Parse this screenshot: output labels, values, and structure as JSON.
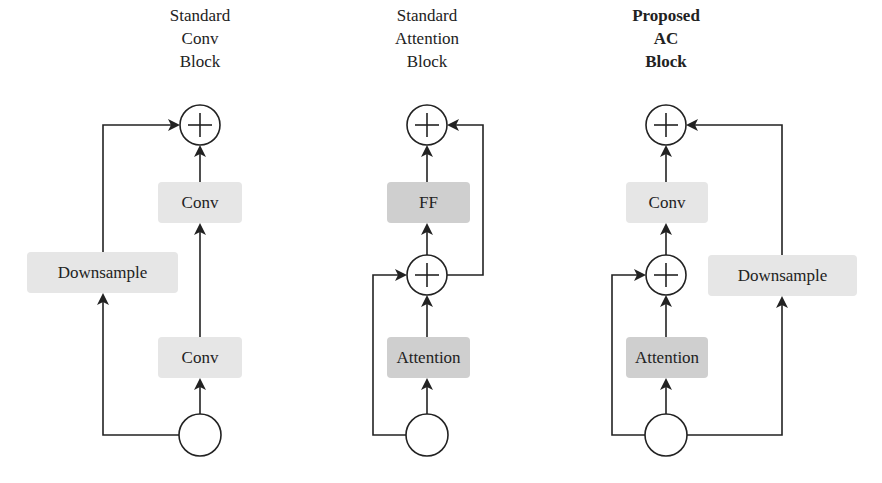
{
  "colors": {
    "background": "#ffffff",
    "line": "#222222",
    "light_box": "#e6e6e6",
    "dark_box": "#cfcfcf"
  },
  "blocks": [
    {
      "title": [
        "Standard",
        "Conv",
        "Block"
      ],
      "title_bold": false,
      "nodes": [
        {
          "id": "sum",
          "type": "add",
          "label": "+"
        },
        {
          "id": "conv2",
          "type": "box",
          "label": "Conv",
          "shade": "light"
        },
        {
          "id": "downsample",
          "type": "box",
          "label": "Downsample",
          "shade": "light"
        },
        {
          "id": "conv1",
          "type": "box",
          "label": "Conv",
          "shade": "light"
        },
        {
          "id": "input",
          "type": "input-node",
          "label": ""
        }
      ],
      "edges": [
        [
          "input",
          "conv1"
        ],
        [
          "conv1",
          "conv2"
        ],
        [
          "conv2",
          "sum"
        ],
        [
          "input",
          "downsample"
        ],
        [
          "downsample",
          "sum"
        ]
      ]
    },
    {
      "title": [
        "Standard",
        "Attention",
        "Block"
      ],
      "title_bold": false,
      "nodes": [
        {
          "id": "sum2",
          "type": "add",
          "label": "+"
        },
        {
          "id": "ff",
          "type": "box",
          "label": "FF",
          "shade": "dark"
        },
        {
          "id": "sum1",
          "type": "add",
          "label": "+"
        },
        {
          "id": "attention",
          "type": "box",
          "label": "Attention",
          "shade": "dark"
        },
        {
          "id": "input",
          "type": "input-node",
          "label": ""
        }
      ],
      "edges": [
        [
          "input",
          "attention"
        ],
        [
          "attention",
          "sum1"
        ],
        [
          "input",
          "sum1"
        ],
        [
          "sum1",
          "ff"
        ],
        [
          "ff",
          "sum2"
        ],
        [
          "sum1",
          "sum2"
        ]
      ]
    },
    {
      "title": [
        "Proposed",
        "AC",
        "Block"
      ],
      "title_bold": true,
      "nodes": [
        {
          "id": "sum2",
          "type": "add",
          "label": "+"
        },
        {
          "id": "conv",
          "type": "box",
          "label": "Conv",
          "shade": "light"
        },
        {
          "id": "sum1",
          "type": "add",
          "label": "+"
        },
        {
          "id": "attention",
          "type": "box",
          "label": "Attention",
          "shade": "dark"
        },
        {
          "id": "downsample",
          "type": "box",
          "label": "Downsample",
          "shade": "light"
        },
        {
          "id": "input",
          "type": "input-node",
          "label": ""
        }
      ],
      "edges": [
        [
          "input",
          "attention"
        ],
        [
          "attention",
          "sum1"
        ],
        [
          "input",
          "sum1"
        ],
        [
          "sum1",
          "conv"
        ],
        [
          "conv",
          "sum2"
        ],
        [
          "input",
          "downsample"
        ],
        [
          "downsample",
          "sum2"
        ]
      ]
    }
  ],
  "labels": {
    "b1_title_1": "Standard",
    "b1_title_2": "Conv",
    "b1_title_3": "Block",
    "b1_conv_top": "Conv",
    "b1_downsample": "Downsample",
    "b1_conv_bottom": "Conv",
    "b2_title_1": "Standard",
    "b2_title_2": "Attention",
    "b2_title_3": "Block",
    "b2_ff": "FF",
    "b2_attention": "Attention",
    "b3_title_1": "Proposed",
    "b3_title_2": "AC",
    "b3_title_3": "Block",
    "b3_conv": "Conv",
    "b3_attention": "Attention",
    "b3_downsample": "Downsample",
    "plus": "+"
  }
}
